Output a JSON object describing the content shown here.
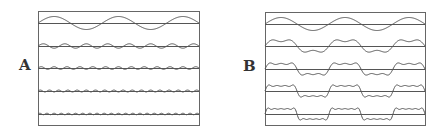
{
  "figure": {
    "panels": [
      {
        "label": "A",
        "label_pos": [
          19,
          58
        ],
        "box": [
          38,
          11,
          199,
          125
        ]
      },
      {
        "label": "B",
        "label_pos": [
          243,
          59
        ],
        "box": [
          265,
          12,
          425,
          125
        ]
      }
    ],
    "line_color": "#555555",
    "frame_color": "#666666"
  },
  "chart_data": [
    {
      "type": "line",
      "title": "A",
      "description": "Individual odd harmonics of a square wave (Fourier components), each on its own baseline",
      "series": [
        {
          "name": "harmonic 1",
          "harmonic": 1,
          "amplitude_px": 6.5,
          "baseline_y": 23
        },
        {
          "name": "harmonic 3",
          "harmonic": 3,
          "amplitude_px": 2.2,
          "baseline_y": 46
        },
        {
          "name": "harmonic 5",
          "harmonic": 5,
          "amplitude_px": 1.3,
          "baseline_y": 68
        },
        {
          "name": "harmonic 7",
          "harmonic": 7,
          "amplitude_px": 0.95,
          "baseline_y": 91
        },
        {
          "name": "harmonic 9",
          "harmonic": 9,
          "amplitude_px": 0.75,
          "baseline_y": 114
        }
      ],
      "periods_across": 2.5,
      "xlabel": "",
      "ylabel": "",
      "grid": false
    },
    {
      "type": "line",
      "title": "B",
      "description": "Cumulative partial sums of odd harmonics converging to a square wave",
      "series": [
        {
          "name": "sum up to 1st",
          "max_harmonic": 1,
          "baseline_y": 24
        },
        {
          "name": "sum up to 3rd",
          "max_harmonic": 3,
          "baseline_y": 46
        },
        {
          "name": "sum up to 5th",
          "max_harmonic": 5,
          "baseline_y": 69
        },
        {
          "name": "sum up to 7th",
          "max_harmonic": 7,
          "baseline_y": 91
        },
        {
          "name": "sum up to 9th",
          "max_harmonic": 9,
          "baseline_y": 114
        }
      ],
      "fundamental_amplitude_px": 6.5,
      "periods_across": 2.5,
      "xlabel": "",
      "ylabel": "",
      "grid": false
    }
  ]
}
